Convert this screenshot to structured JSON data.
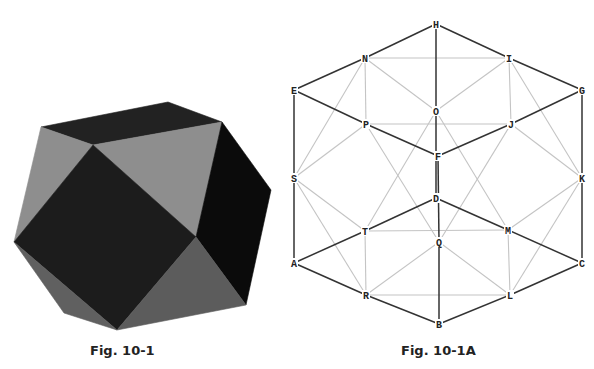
{
  "figures": [
    {
      "caption": "Fig. 10-1",
      "description": "Shaded cuboctahedron-like solid",
      "colors": {
        "dark": "#1c1c1c",
        "light": "#8e8e8e",
        "mid": "#5c5c5c",
        "black": "#0b0b0b"
      },
      "faces": [
        {
          "name": "top-face",
          "points": "41,127 168,102 222,122 93,145",
          "fill": "#222222"
        },
        {
          "name": "left-light-face",
          "points": "41,127 93,145 14,242",
          "fill": "#8e8e8e"
        },
        {
          "name": "upper-middle-light-face",
          "points": "93,145 222,122 196,237",
          "fill": "#8e8e8e"
        },
        {
          "name": "center-square-face",
          "points": "93,145 196,237 117,330 14,242",
          "fill": "#1c1c1c"
        },
        {
          "name": "right-black-face",
          "points": "222,122 271,190 246,305 196,237",
          "fill": "#0b0b0b"
        },
        {
          "name": "bottom-gray-face",
          "points": "196,237 246,305 117,330",
          "fill": "#5c5c5c"
        },
        {
          "name": "lower-left-gray-face",
          "points": "14,242 117,330 64,313",
          "fill": "#606060"
        }
      ]
    },
    {
      "caption": "Fig. 10-1A",
      "description": "Labeled vertex/edge wireframe diagram",
      "nodes": [
        {
          "id": "H",
          "x": 436,
          "y": 24
        },
        {
          "id": "N",
          "x": 365,
          "y": 58
        },
        {
          "id": "I",
          "x": 509,
          "y": 58
        },
        {
          "id": "E",
          "x": 294,
          "y": 90
        },
        {
          "id": "G",
          "x": 582,
          "y": 90
        },
        {
          "id": "O",
          "x": 436,
          "y": 111
        },
        {
          "id": "P",
          "x": 366,
          "y": 124
        },
        {
          "id": "J",
          "x": 511,
          "y": 124
        },
        {
          "id": "F",
          "x": 438,
          "y": 156
        },
        {
          "id": "S",
          "x": 294,
          "y": 178
        },
        {
          "id": "K",
          "x": 582,
          "y": 178
        },
        {
          "id": "D",
          "x": 436,
          "y": 198
        },
        {
          "id": "T",
          "x": 365,
          "y": 231
        },
        {
          "id": "M",
          "x": 508,
          "y": 230
        },
        {
          "id": "Q",
          "x": 439,
          "y": 242
        },
        {
          "id": "A",
          "x": 294,
          "y": 263
        },
        {
          "id": "C",
          "x": 582,
          "y": 263
        },
        {
          "id": "R",
          "x": 366,
          "y": 295
        },
        {
          "id": "L",
          "x": 510,
          "y": 295
        },
        {
          "id": "B",
          "x": 439,
          "y": 324
        }
      ],
      "dark_edges": [
        [
          "H",
          "N"
        ],
        [
          "H",
          "I"
        ],
        [
          "H",
          "O"
        ],
        [
          "N",
          "E"
        ],
        [
          "I",
          "G"
        ],
        [
          "E",
          "P"
        ],
        [
          "P",
          "F"
        ],
        [
          "F",
          "J"
        ],
        [
          "J",
          "G"
        ],
        [
          "E",
          "S"
        ],
        [
          "G",
          "K"
        ],
        [
          "S",
          "A"
        ],
        [
          "K",
          "C"
        ],
        [
          "A",
          "T"
        ],
        [
          "T",
          "D"
        ],
        [
          "D",
          "M"
        ],
        [
          "M",
          "C"
        ],
        [
          "A",
          "R"
        ],
        [
          "R",
          "B"
        ],
        [
          "B",
          "L"
        ],
        [
          "L",
          "C"
        ],
        [
          "O",
          "D"
        ],
        [
          "F",
          "Q"
        ],
        [
          "Q",
          "B"
        ]
      ],
      "light_edges": [
        [
          "N",
          "I"
        ],
        [
          "N",
          "O"
        ],
        [
          "N",
          "P"
        ],
        [
          "N",
          "S"
        ],
        [
          "O",
          "I"
        ],
        [
          "I",
          "J"
        ],
        [
          "I",
          "K"
        ],
        [
          "P",
          "J"
        ],
        [
          "P",
          "S"
        ],
        [
          "P",
          "Q"
        ],
        [
          "J",
          "K"
        ],
        [
          "J",
          "Q"
        ],
        [
          "O",
          "T"
        ],
        [
          "O",
          "M"
        ],
        [
          "S",
          "T"
        ],
        [
          "S",
          "R"
        ],
        [
          "K",
          "M"
        ],
        [
          "K",
          "L"
        ],
        [
          "T",
          "M"
        ],
        [
          "T",
          "R"
        ],
        [
          "M",
          "L"
        ],
        [
          "R",
          "Q"
        ],
        [
          "Q",
          "L"
        ],
        [
          "R",
          "L"
        ]
      ],
      "colors": {
        "dark_edge": "#333333",
        "light_edge": "#c4c4c4"
      }
    }
  ]
}
